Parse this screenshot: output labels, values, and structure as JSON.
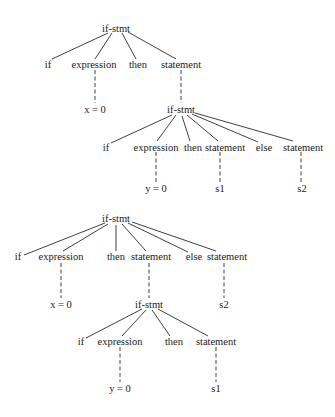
{
  "tree1": {
    "root": "if-stmt",
    "children": [
      "if",
      "expression",
      "then",
      "statement"
    ],
    "expr_leaf": "x = 0",
    "inner": {
      "root": "if-stmt",
      "children": [
        "if",
        "expression",
        "then",
        "statement",
        "else",
        "statement"
      ],
      "expr_leaf": "y = 0",
      "then_leaf": "s1",
      "else_leaf": "s2"
    }
  },
  "tree2": {
    "root": "if-stmt",
    "children": [
      "if",
      "expression",
      "then",
      "statement",
      "else",
      "statement"
    ],
    "expr_leaf": "x = 0",
    "else_leaf": "s2",
    "inner": {
      "root": "if-stmt",
      "children": [
        "if",
        "expression",
        "then",
        "statement"
      ],
      "expr_leaf": "y = 0",
      "then_leaf": "s1"
    }
  }
}
